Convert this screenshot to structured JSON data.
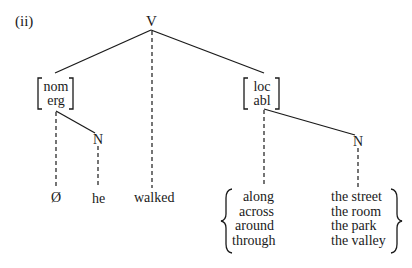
{
  "example_label": "(ii)",
  "tree": {
    "root": "V",
    "left_case": {
      "features": [
        "nom",
        "erg"
      ]
    },
    "left_noun": "N",
    "right_case": {
      "features": [
        "loc",
        "abl"
      ]
    },
    "right_noun": "N",
    "leaves": {
      "left_case_realization": "Ø",
      "left_noun_word": "he",
      "verb_word": "walked"
    },
    "prepositions": [
      "along",
      "across",
      "around",
      "through"
    ],
    "noun_phrases": [
      "the street",
      "the room",
      "the park",
      "the valley"
    ]
  }
}
